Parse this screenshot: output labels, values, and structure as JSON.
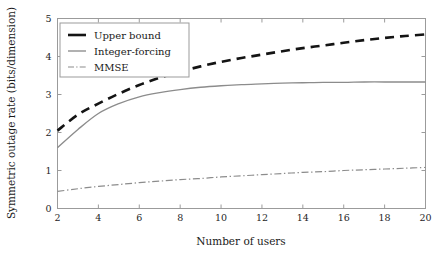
{
  "chart_data": {
    "type": "line",
    "title": "",
    "xlabel": "Number of users",
    "ylabel": "Symmetric outage rate (bits/dimension)",
    "xlim": [
      2,
      20
    ],
    "ylim": [
      0,
      5
    ],
    "xticks": [
      2,
      4,
      6,
      8,
      10,
      12,
      14,
      16,
      18,
      20
    ],
    "yticks": [
      0,
      1,
      2,
      3,
      4,
      5
    ],
    "xtick_labels": [
      "2",
      "4",
      "6",
      "8",
      "10",
      "12",
      "14",
      "16",
      "18",
      "20"
    ],
    "ytick_labels": [
      "0",
      "1",
      "2",
      "3",
      "4",
      "5"
    ],
    "grid": false,
    "legend_position": "upper left",
    "series": [
      {
        "name": "Upper bound",
        "style": "dashed",
        "color": "#141414",
        "x": [
          2,
          3,
          4,
          5,
          6,
          7,
          8,
          9,
          10,
          11,
          12,
          13,
          14,
          15,
          16,
          17,
          18,
          19,
          20
        ],
        "values": [
          2.05,
          2.47,
          2.76,
          3.02,
          3.25,
          3.44,
          3.6,
          3.74,
          3.86,
          3.96,
          4.05,
          4.14,
          4.22,
          4.29,
          4.36,
          4.43,
          4.49,
          4.54,
          4.58
        ]
      },
      {
        "name": "Integer-forcing",
        "style": "solid",
        "color": "#8c8c8c",
        "x": [
          2,
          3,
          4,
          5,
          6,
          7,
          8,
          9,
          10,
          11,
          12,
          13,
          14,
          15,
          16,
          17,
          18,
          19,
          20
        ],
        "values": [
          1.6,
          2.08,
          2.5,
          2.76,
          2.94,
          3.05,
          3.13,
          3.19,
          3.23,
          3.26,
          3.28,
          3.3,
          3.31,
          3.32,
          3.32,
          3.33,
          3.33,
          3.33,
          3.33
        ]
      },
      {
        "name": "MMSE",
        "style": "dashdot",
        "color": "#8c8c8c",
        "x": [
          2,
          3,
          4,
          5,
          6,
          7,
          8,
          9,
          10,
          11,
          12,
          13,
          14,
          15,
          16,
          17,
          18,
          19,
          20
        ],
        "values": [
          0.45,
          0.52,
          0.58,
          0.63,
          0.68,
          0.72,
          0.76,
          0.79,
          0.83,
          0.86,
          0.89,
          0.92,
          0.95,
          0.97,
          1.0,
          1.02,
          1.04,
          1.06,
          1.08
        ]
      }
    ]
  },
  "legend": {
    "entries": [
      {
        "label": "Upper bound"
      },
      {
        "label": "Integer-forcing"
      },
      {
        "label": "MMSE"
      }
    ]
  }
}
